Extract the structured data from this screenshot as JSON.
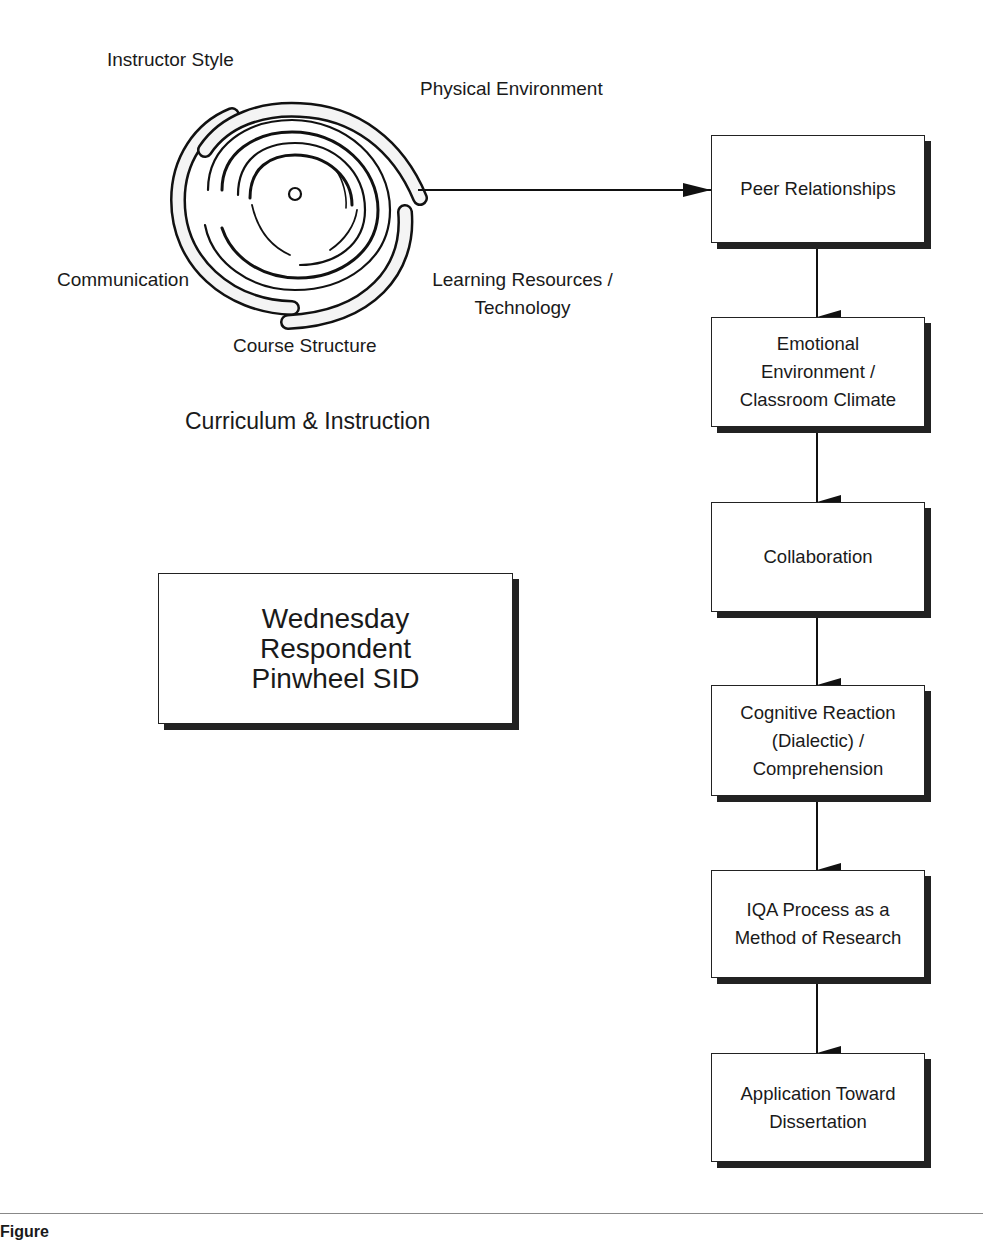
{
  "figure": {
    "pinwheel": {
      "labels": [
        {
          "id": "instructor-style",
          "text": "Instructor Style"
        },
        {
          "id": "physical-environment",
          "text": "Physical Environment"
        },
        {
          "id": "communication",
          "text": "Communication"
        },
        {
          "id": "learning-resources",
          "text": "Learning Resources /\nTechnology"
        },
        {
          "id": "course-structure",
          "text": "Course Structure"
        }
      ],
      "group_label": "Curriculum & Instruction"
    },
    "title_box": {
      "text": "Wednesday\nRespondent\nPinwheel SID"
    },
    "flow": [
      {
        "text": "Peer Relationships"
      },
      {
        "text": "Emotional\nEnvironment /\nClassroom Climate"
      },
      {
        "text": "Collaboration"
      },
      {
        "text": "Cognitive Reaction\n(Dialectic) /\nComprehension"
      },
      {
        "text": "IQA Process as a\nMethod of Research"
      },
      {
        "text": "Application Toward\nDissertation"
      }
    ],
    "caption": "Figure"
  },
  "colors": {
    "ink": "#1a1a1a",
    "shadow": "#222222",
    "rule": "#888888",
    "background": "#ffffff"
  }
}
